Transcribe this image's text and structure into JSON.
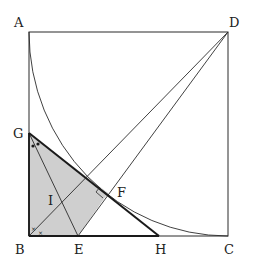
{
  "diagram": {
    "type": "geometry",
    "colors": {
      "stroke": "#2b2b2b",
      "shade": "#cfcfcf",
      "background": "#ffffff"
    },
    "points": {
      "A": {
        "label": "A",
        "x": 29,
        "y": 32
      },
      "D": {
        "label": "D",
        "x": 228,
        "y": 32
      },
      "B": {
        "label": "B",
        "x": 29,
        "y": 236
      },
      "C": {
        "label": "C",
        "x": 228,
        "y": 236
      },
      "G": {
        "label": "G",
        "x": 29,
        "y": 133
      },
      "E": {
        "label": "E",
        "x": 78,
        "y": 236
      },
      "H": {
        "label": "H",
        "x": 159,
        "y": 236
      },
      "F": {
        "label": "F",
        "x": 108,
        "y": 193
      },
      "I": {
        "label": "I",
        "x": 62,
        "y": 203
      }
    },
    "labels": {
      "A": "A",
      "B": "B",
      "C": "C",
      "D": "D",
      "E": "E",
      "F": "F",
      "G": "G",
      "H": "H",
      "I": "I"
    },
    "marks": {
      "angle_B_mark": "×",
      "angle_G_mark": "•",
      "right_angle_at": "F"
    },
    "segments": [
      "AB",
      "BC",
      "CD",
      "DA",
      "BD",
      "ED",
      "GH",
      "GE"
    ],
    "arc": {
      "center": "D",
      "from": "A",
      "to": "C"
    },
    "shaded_region": [
      "B",
      "G",
      "F",
      "E"
    ]
  }
}
